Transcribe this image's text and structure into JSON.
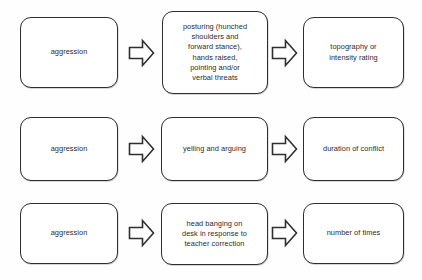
{
  "diagram": {
    "type": "flow-grid",
    "title": "",
    "rows": [
      {
        "behavior_label": "aggression",
        "definition": "posturing  (hunched\nshoulders and\nforward stance),\nhands raised,\npointing and/or\nverbal threats",
        "measurement": "topography or\nintensity rating",
        "arrow_1": "right-arrow",
        "arrow_2": "right-arrow"
      },
      {
        "behavior_label": "aggression",
        "definition": "yelling and arguing",
        "measurement": "duration of conflict",
        "arrow_1": "right-arrow",
        "arrow_2": "right-arrow"
      },
      {
        "behavior_label": "aggression",
        "definition": "head banging on\ndesk in response to\nteacher correction",
        "measurement": "number of times",
        "arrow_1": "right-arrow",
        "arrow_2": "right-arrow"
      }
    ],
    "colors": {
      "background": "#fefefe",
      "box_fill": "#ffffff",
      "box_border": "#2e2e2e",
      "text": "#2b2b2b",
      "arrow_fill": "#ffffff",
      "arrow_border": "#2f2f2f"
    }
  }
}
